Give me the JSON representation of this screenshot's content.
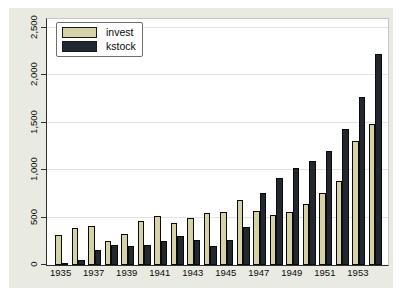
{
  "chart_data": {
    "type": "bar",
    "title": "",
    "categories": [
      "1935",
      "1936",
      "1937",
      "1938",
      "1939",
      "1940",
      "1941",
      "1942",
      "1943",
      "1944",
      "1945",
      "1946",
      "1947",
      "1948",
      "1949",
      "1950",
      "1951",
      "1952",
      "1953",
      "1954"
    ],
    "series": [
      {
        "name": "invest",
        "color": "#d6d2a8",
        "values": [
          317.6,
          391.8,
          410.6,
          257.7,
          330.8,
          461.2,
          512.0,
          448.0,
          499.6,
          547.5,
          561.2,
          688.1,
          568.9,
          529.2,
          555.1,
          642.9,
          755.9,
          891.2,
          1304.4,
          1486.7
        ]
      },
      {
        "name": "kstock",
        "color": "#232830",
        "values": [
          2.8,
          52.6,
          156.9,
          209.2,
          203.4,
          207.2,
          255.2,
          303.7,
          264.1,
          201.6,
          265.0,
          402.2,
          761.5,
          922.4,
          1020.1,
          1099.0,
          1207.7,
          1430.5,
          1777.3,
          2226.3
        ]
      }
    ],
    "x_tick_labels": [
      "1935",
      "1937",
      "1939",
      "1941",
      "1943",
      "1945",
      "1947",
      "1949",
      "1951",
      "1953"
    ],
    "y_tick_labels": [
      "0",
      "500",
      "1,000",
      "1,500",
      "2,000",
      "2,500"
    ],
    "y_tick_values": [
      0,
      500,
      1000,
      1500,
      2000,
      2500
    ],
    "ylim": [
      0,
      2500
    ],
    "grid": true,
    "legend_position": "top-left",
    "xlabel": "",
    "ylabel": ""
  },
  "colors": {
    "canvas_background": "#e9eae1",
    "plot_background": "#ffffff",
    "gridline": "#e2e2e2",
    "axis": "#303030",
    "invest_fill": "#d6d2a8",
    "kstock_fill": "#232830"
  }
}
